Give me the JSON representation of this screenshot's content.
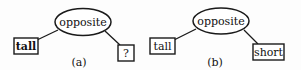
{
  "diagram": {
    "panels": [
      {
        "caption": "(a)",
        "center_node": {
          "label": "opposite",
          "shape": "ellipse"
        },
        "left_node": {
          "label": "tall",
          "shape": "box"
        },
        "right_node": {
          "label": "?",
          "shape": "box"
        }
      },
      {
        "caption": "(b)",
        "center_node": {
          "label": "opposite",
          "shape": "ellipse"
        },
        "left_node": {
          "label": "tall",
          "shape": "box"
        },
        "right_node": {
          "label": "short",
          "shape": "box"
        }
      }
    ],
    "colors": {
      "stroke": "#1a1a1a",
      "text": "#111111",
      "background": "#fdfdfd"
    }
  }
}
